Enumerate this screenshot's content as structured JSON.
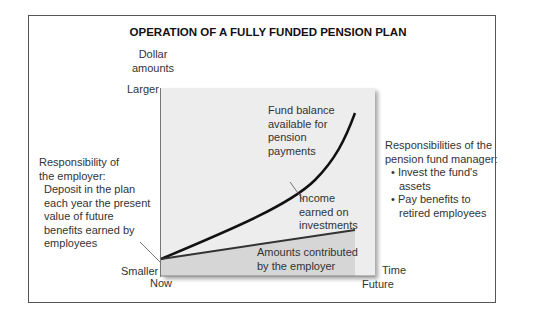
{
  "title": "OPERATION OF A FULLY FUNDED PENSION PLAN",
  "y_axis": {
    "label_line1": "Dollar",
    "label_line2": "amounts",
    "top": "Larger",
    "bottom": "Smaller"
  },
  "x_axis": {
    "label": "Time",
    "left": "Now",
    "right": "Future"
  },
  "curve_label": [
    "Fund balance",
    "available for",
    "pension",
    "payments"
  ],
  "income_label": [
    "Income",
    "earned on",
    "investments"
  ],
  "employer_area_label": [
    "Amounts contributed",
    "by the employer"
  ],
  "employer_resp": {
    "heading": [
      "Responsibility of",
      "the employer:"
    ],
    "body": [
      "Deposit in the plan",
      "each year the present",
      "value of future",
      "benefits earned by",
      "employees"
    ]
  },
  "manager_resp": {
    "heading": [
      "Responsibilities of the",
      "pension fund manager:"
    ],
    "bullets": [
      [
        "Invest the fund's",
        "assets"
      ],
      [
        "Pay benefits to",
        "retired employees"
      ]
    ]
  },
  "colors": {
    "panel": "#ededed",
    "lower_area": "#d6d6d6",
    "curve": "#111111",
    "frame": "#555555"
  }
}
